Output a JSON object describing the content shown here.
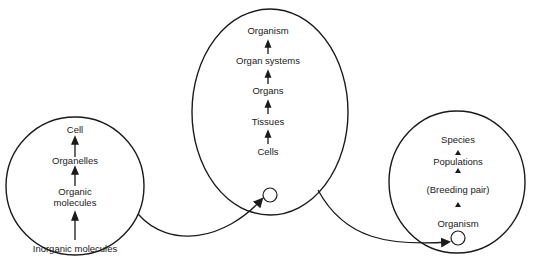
{
  "diagram": {
    "type": "levels-of-organisation",
    "colors": {
      "stroke": "#1a1a1a",
      "background": "#ffffff",
      "text": "#1a1a1a"
    },
    "groups": [
      {
        "id": "cellular",
        "levels_bottom_to_top": [
          "Organic molecules",
          "Organelles",
          "Cell"
        ],
        "labels": {
          "cell": "Cell",
          "organelles": "Organelles",
          "organic_1": "Organic",
          "organic_2": "molecules"
        }
      },
      {
        "id": "organism",
        "levels_bottom_to_top": [
          "Cells",
          "Tissues",
          "Organs",
          "Organ systems",
          "Organism"
        ],
        "labels": {
          "organism": "Organism",
          "organ_systems": "Organ systems",
          "organs": "Organs",
          "tissues": "Tissues",
          "cells": "Cells"
        }
      },
      {
        "id": "population",
        "levels_bottom_to_top": [
          "Organism",
          "(Breeding pair)",
          "Populations",
          "Species"
        ],
        "labels": {
          "species": "Species",
          "populations": "Populations",
          "breeding_pair": "(Breeding pair)",
          "organism": "Organism"
        }
      }
    ],
    "external": {
      "inorganic": "Inorganic molecules"
    },
    "connectors": [
      {
        "from": "cellular",
        "to": "organism.cells",
        "meaning": "a whole cell becomes one unit in the next level"
      },
      {
        "from": "organism",
        "to": "population.organism",
        "meaning": "a whole organism becomes one unit in the next level"
      }
    ]
  }
}
